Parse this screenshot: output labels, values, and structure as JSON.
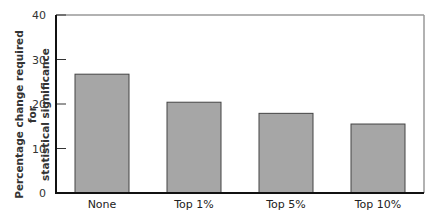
{
  "chart_data": {
    "type": "bar",
    "title": "",
    "xlabel": "",
    "ylabel": "Percentage change required for statistical significance",
    "ylabel_lines": [
      "Percentage change required for",
      "statistical significance"
    ],
    "categories": [
      "None",
      "Top 1%",
      "Top 5%",
      "Top 10%"
    ],
    "values": [
      26.7,
      20.4,
      17.9,
      15.5
    ],
    "ylim": [
      0,
      40
    ],
    "yticks": [
      0,
      10,
      20,
      30,
      40
    ],
    "grid": false,
    "legend": null,
    "bar_color": "#a6a6a6",
    "bar_edge_color": "#444444",
    "axis_color": "#111111"
  }
}
